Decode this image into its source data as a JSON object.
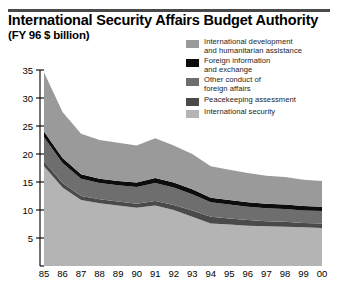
{
  "header": {
    "title": "International Security Affairs Budget Authority",
    "subtitle": "(FY 96 $ billion)"
  },
  "legend": {
    "items": [
      {
        "label_line1": "International development",
        "label_line2": "and humanitarian assistance",
        "color": "#9a9a9a",
        "key": "international-development"
      },
      {
        "label_line1": "Foreign information",
        "label_line2": "and exchange",
        "color": "#0d0d0d",
        "key": "foreign-information"
      },
      {
        "label_line1": "Other conduct of",
        "label_line2": "foreign affairs",
        "color": "#6e6e6e",
        "key": "other-conduct"
      },
      {
        "label_line1": "Peacekeeping assessment",
        "label_line2": "",
        "color": "#4a4a4a",
        "key": "peacekeeping-assessment"
      },
      {
        "label_line1": "International security",
        "label_line2": "",
        "color": "#b4b4b4",
        "key": "international-security"
      }
    ]
  },
  "chart_data": {
    "type": "area",
    "stacked": true,
    "title": "International Security Affairs Budget Authority",
    "subtitle": "(FY 96 $ billion)",
    "xlabel": "",
    "ylabel": "",
    "ylim": [
      0,
      35
    ],
    "yticks": [
      5,
      10,
      15,
      20,
      25,
      30,
      35
    ],
    "ytick_labels": [
      "5",
      "10",
      "15",
      "20",
      "25",
      "30",
      "35"
    ],
    "grid": false,
    "legend_position": "top-right",
    "x": [
      "85",
      "86",
      "87",
      "88",
      "89",
      "90",
      "91",
      "92",
      "93",
      "94",
      "95",
      "96",
      "97",
      "98",
      "99",
      "00"
    ],
    "xtick_labels": [
      "85",
      "86",
      "87",
      "88",
      "89",
      "90",
      "91",
      "92",
      "93",
      "94",
      "95",
      "96",
      "97",
      "98",
      "99",
      "00"
    ],
    "series": [
      {
        "name": "International security",
        "color": "#b4b4b4",
        "values": [
          17.8,
          14.0,
          11.8,
          11.2,
          10.8,
          10.4,
          10.8,
          10.0,
          8.8,
          7.6,
          7.4,
          7.2,
          7.1,
          7.0,
          6.9,
          6.8
        ]
      },
      {
        "name": "Peacekeeping assessment",
        "color": "#4a4a4a",
        "values": [
          0.9,
          0.8,
          0.7,
          0.7,
          0.7,
          0.7,
          0.8,
          0.9,
          1.1,
          1.2,
          1.1,
          1.0,
          0.9,
          0.9,
          0.8,
          0.8
        ]
      },
      {
        "name": "Other conduct of foreign affairs",
        "color": "#6e6e6e",
        "values": [
          4.3,
          3.6,
          3.1,
          2.9,
          2.9,
          3.0,
          3.2,
          3.1,
          2.9,
          2.6,
          2.5,
          2.4,
          2.3,
          2.3,
          2.2,
          2.2
        ]
      },
      {
        "name": "Foreign information and exchange",
        "color": "#0d0d0d",
        "values": [
          1.0,
          0.9,
          0.8,
          0.8,
          0.8,
          0.8,
          0.9,
          0.9,
          0.9,
          0.8,
          0.8,
          0.8,
          0.8,
          0.8,
          0.8,
          0.8
        ]
      },
      {
        "name": "International development and humanitarian assistance",
        "color": "#9a9a9a",
        "values": [
          10.6,
          8.2,
          7.2,
          6.9,
          6.8,
          6.6,
          7.1,
          6.6,
          6.3,
          5.6,
          5.4,
          5.2,
          5.0,
          4.9,
          4.7,
          4.6
        ]
      }
    ],
    "totals": [
      34.6,
      27.5,
      23.6,
      22.5,
      22.0,
      21.5,
      22.8,
      21.5,
      20.0,
      17.8,
      17.2,
      16.6,
      16.1,
      15.9,
      15.4,
      15.2
    ]
  }
}
